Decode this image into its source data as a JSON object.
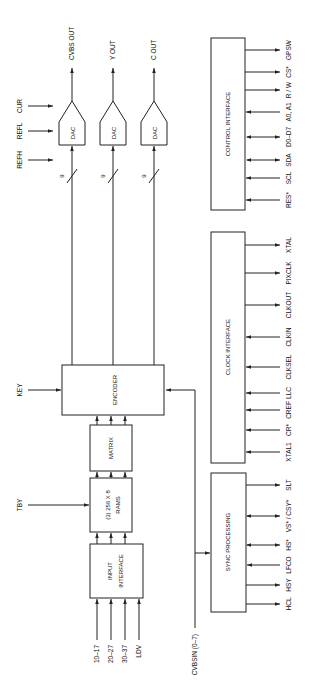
{
  "colors": {
    "line": "#222222",
    "background": "#ffffff",
    "text": "#111111"
  },
  "dac": {
    "label": "DAC",
    "bus_width": "9",
    "refs": [
      "REFH",
      "REFL",
      "CUR"
    ],
    "outputs": [
      "CVBS OUT",
      "Y OUT",
      "C OUT"
    ]
  },
  "encoder": {
    "label": "ENCODER",
    "key_input": "KEY"
  },
  "matrix": {
    "label": "MATRIX"
  },
  "rams": {
    "line1": "(3)  256  X  8",
    "line2": "RAMS",
    "tby_input": "TBY"
  },
  "input_interface": {
    "line1": "INPUT",
    "line2": "INTERFACE",
    "inputs": [
      "10–17",
      "20–27",
      "30–37",
      "LDV"
    ]
  },
  "cvbsin": {
    "label": "CVBSIN (0–7)"
  },
  "sync": {
    "label": "SYNC  PROCESSING",
    "pins": [
      "SLT",
      "VS* / CSY*",
      "HS*",
      "LFCO",
      "HSY",
      "HCL"
    ]
  },
  "clock": {
    "label": "CLOCK  INTERFACE",
    "pins": [
      "XTAL",
      "PIXCLK",
      "CLKOUT",
      "CLKIN",
      "CLKSEL",
      "LLC",
      "CREF",
      "CR*",
      "XTAL1"
    ]
  },
  "control": {
    "label": "CONTROL  INTERFACE",
    "pins": [
      "GPSW",
      "CS*",
      "R / W",
      "A0, A1",
      "D0–D7",
      "SDA",
      "SCL",
      "RES*"
    ]
  }
}
